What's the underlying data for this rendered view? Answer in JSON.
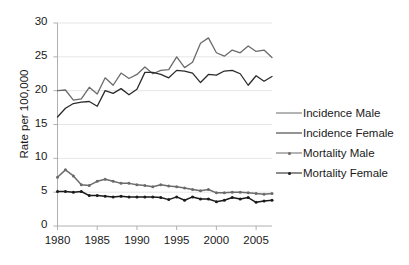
{
  "chart_data": {
    "type": "line",
    "title": "",
    "xlabel": "",
    "ylabel": "Rate per 100,000",
    "xlim": [
      1980,
      2007
    ],
    "ylim": [
      0,
      30
    ],
    "yticks": [
      0,
      5,
      10,
      15,
      20,
      25,
      30
    ],
    "xticks": [
      1980,
      1985,
      1990,
      1995,
      2000,
      2005
    ],
    "grid": true,
    "legend_position": "right",
    "x": [
      1980,
      1981,
      1982,
      1983,
      1984,
      1985,
      1986,
      1987,
      1988,
      1989,
      1990,
      1991,
      1992,
      1993,
      1994,
      1995,
      1996,
      1997,
      1998,
      1999,
      2000,
      2001,
      2002,
      2003,
      2004,
      2005,
      2006,
      2007
    ],
    "series": [
      {
        "name": "Incidence Male",
        "color": "#6b6b6b",
        "marker": "none",
        "values": [
          20.0,
          20.1,
          18.6,
          18.8,
          20.5,
          19.5,
          21.9,
          20.8,
          22.6,
          21.8,
          22.4,
          23.5,
          22.5,
          23.0,
          23.1,
          25.0,
          23.4,
          24.2,
          27.0,
          27.8,
          25.6,
          25.1,
          26.0,
          25.6,
          26.6,
          25.8,
          26.0,
          24.9
        ]
      },
      {
        "name": "Incidence Female",
        "color": "#2b2b2b",
        "marker": "none",
        "values": [
          16.1,
          17.4,
          18.1,
          18.3,
          18.4,
          17.7,
          20.0,
          19.6,
          20.3,
          19.4,
          20.2,
          22.7,
          22.7,
          22.4,
          21.9,
          23.0,
          22.9,
          22.6,
          21.2,
          22.4,
          22.3,
          22.9,
          23.0,
          22.5,
          20.8,
          22.2,
          21.4,
          22.1
        ]
      },
      {
        "name": "Mortality Male",
        "color": "#6b6b6b",
        "marker": "dot",
        "values": [
          7.2,
          8.3,
          7.4,
          6.1,
          6.0,
          6.6,
          6.9,
          6.6,
          6.3,
          6.3,
          6.1,
          6.0,
          5.8,
          6.1,
          5.9,
          5.8,
          5.6,
          5.4,
          5.2,
          5.4,
          4.9,
          4.9,
          5.0,
          5.0,
          4.9,
          4.8,
          4.7,
          4.8
        ]
      },
      {
        "name": "Mortality Female",
        "color": "#1a1a1a",
        "marker": "dot",
        "values": [
          5.1,
          5.1,
          5.0,
          5.1,
          4.5,
          4.5,
          4.4,
          4.3,
          4.4,
          4.3,
          4.3,
          4.3,
          4.3,
          4.2,
          3.9,
          4.3,
          3.8,
          4.3,
          4.0,
          4.0,
          3.6,
          3.8,
          4.2,
          4.0,
          4.2,
          3.5,
          3.7,
          3.8
        ]
      }
    ]
  },
  "legend": {
    "items": [
      {
        "label": "Incidence Male"
      },
      {
        "label": "Incidence Female"
      },
      {
        "label": "Mortality Male"
      },
      {
        "label": "Mortality Female"
      }
    ]
  },
  "axes": {
    "y_title": "Rate per 100,000"
  }
}
